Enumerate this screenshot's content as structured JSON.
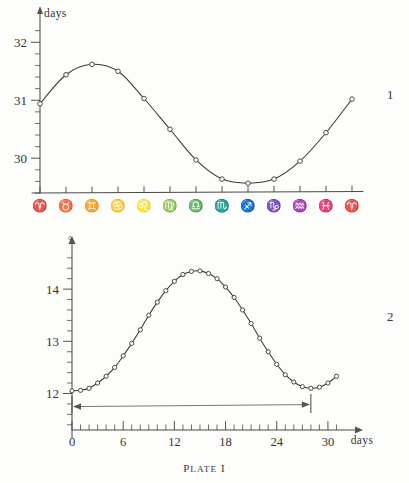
{
  "plate_caption": {
    "prefix": "P",
    "rest": "LATE",
    "numeral": " I"
  },
  "figures": [
    {
      "number": "1",
      "y_axis": {
        "unit_label": "days",
        "labels": [
          "32",
          "31",
          "30"
        ],
        "label_values": [
          32,
          31,
          30
        ],
        "range": [
          29.4,
          32.35
        ],
        "minor_tick_step": 0.2
      },
      "x_axis": {
        "tick_labels": [
          "Aries",
          "Taurus",
          "Gemini",
          "Cancer",
          "Leo",
          "Virgo",
          "Libra",
          "Scorpio",
          "Sagittarius",
          "Capricorn",
          "Aquarius",
          "Pisces",
          "Aries"
        ],
        "tick_glyphs": [
          "♈",
          "♉",
          "♊",
          "♋",
          "♌",
          "♍",
          "♎",
          "♏",
          "♐",
          "♑",
          "♒",
          "♓",
          "♈"
        ]
      }
    },
    {
      "number": "2",
      "y_axis": {
        "unit_label": "°",
        "labels": [
          "14",
          "13",
          "12"
        ],
        "label_values": [
          14,
          13,
          12
        ],
        "range": [
          11.3,
          14.75
        ],
        "minor_tick_step": 0.2
      },
      "x_axis": {
        "unit_label": "days",
        "labels": [
          "0",
          "6",
          "12",
          "18",
          "24",
          "30"
        ],
        "label_values": [
          0,
          6,
          12,
          18,
          24,
          30
        ],
        "range": [
          0,
          32
        ],
        "minor_tick_step": 1
      },
      "annotation": {
        "type": "span-arrow",
        "from": 0,
        "to": 28,
        "y_value": 11.72
      }
    }
  ],
  "chart_data": [
    {
      "type": "line",
      "title": "",
      "subtitle": "",
      "xlabel": "",
      "ylabel": "days",
      "ylim": [
        29.4,
        32.35
      ],
      "grid": false,
      "legend": "none",
      "markers": "open-circle",
      "categories": [
        "♈",
        "♉",
        "♊",
        "♋",
        "♌",
        "♍",
        "♎",
        "♏",
        "♐",
        "♑",
        "♒",
        "♓",
        "♈"
      ],
      "category_names": [
        "Aries",
        "Taurus",
        "Gemini",
        "Cancer",
        "Leo",
        "Virgo",
        "Libra",
        "Scorpio",
        "Sagittarius",
        "Capricorn",
        "Aquarius",
        "Pisces",
        "Aries"
      ],
      "values": [
        30.94,
        31.44,
        31.62,
        31.5,
        31.03,
        30.5,
        29.97,
        29.64,
        29.57,
        29.64,
        29.95,
        30.44,
        31.02
      ]
    },
    {
      "type": "line",
      "title": "",
      "subtitle": "",
      "xlabel": "days",
      "ylabel": "°",
      "xlim": [
        0,
        32
      ],
      "ylim": [
        11.3,
        14.75
      ],
      "grid": false,
      "legend": "none",
      "markers": "open-circle",
      "x": [
        0,
        1,
        2,
        3,
        4,
        5,
        6,
        7,
        8,
        9,
        10,
        11,
        12,
        13,
        14,
        15,
        16,
        17,
        18,
        19,
        20,
        21,
        22,
        23,
        24,
        25,
        26,
        27,
        28,
        29,
        30,
        31
      ],
      "values": [
        12.05,
        12.06,
        12.1,
        12.2,
        12.33,
        12.5,
        12.72,
        12.96,
        13.22,
        13.5,
        13.75,
        13.97,
        14.15,
        14.28,
        14.34,
        14.35,
        14.3,
        14.2,
        14.04,
        13.84,
        13.6,
        13.34,
        13.06,
        12.8,
        12.56,
        12.36,
        12.22,
        12.13,
        12.1,
        12.12,
        12.2,
        12.33
      ]
    }
  ]
}
